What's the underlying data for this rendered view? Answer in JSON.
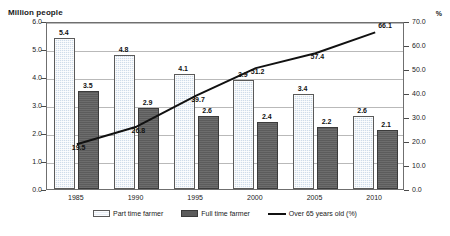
{
  "chart_data": {
    "type": "bar",
    "title": "",
    "subtitle": "",
    "categories": [
      "1985",
      "1990",
      "1995",
      "2000",
      "2005",
      "2010"
    ],
    "xlabel": "",
    "ylabel": "Million people",
    "y2label": "%",
    "ylim": [
      0.0,
      6.0
    ],
    "y2lim": [
      0.0,
      70.0
    ],
    "yticks": [
      "0.0",
      "1.0",
      "2.0",
      "3.0",
      "4.0",
      "5.0",
      "6.0"
    ],
    "y2ticks": [
      "0.0",
      "10.0",
      "20.0",
      "30.0",
      "40.0",
      "50.0",
      "60.0",
      "70.0"
    ],
    "grid": true,
    "legend_position": "bottom",
    "series": [
      {
        "name": "Part time farmer",
        "type": "bar",
        "axis": "left",
        "color": "#cfdcea",
        "values": [
          5.4,
          4.8,
          4.1,
          3.9,
          3.4,
          2.6
        ],
        "labels": [
          "5.4",
          "4.8",
          "4.1",
          "3.9",
          "3.4",
          "2.6"
        ]
      },
      {
        "name": "Full time farmer",
        "type": "bar",
        "axis": "left",
        "color": "#5c5c5c",
        "values": [
          3.5,
          2.9,
          2.6,
          2.4,
          2.2,
          2.1
        ],
        "labels": [
          "3.5",
          "2.9",
          "2.6",
          "2.4",
          "2.2",
          "2.1"
        ]
      },
      {
        "name": "Over 65 years old (%)",
        "type": "line",
        "axis": "right",
        "color": "#111111",
        "values": [
          19.5,
          26.8,
          39.7,
          51.2,
          57.4,
          66.1
        ],
        "labels": [
          "19.5",
          "26.8",
          "39.7",
          "51.2",
          "57.4",
          "66.1"
        ]
      }
    ]
  },
  "legend": {
    "items": [
      {
        "label": "Part time farmer"
      },
      {
        "label": "Full time farmer"
      },
      {
        "label": "Over 65 years old (%)"
      }
    ]
  }
}
